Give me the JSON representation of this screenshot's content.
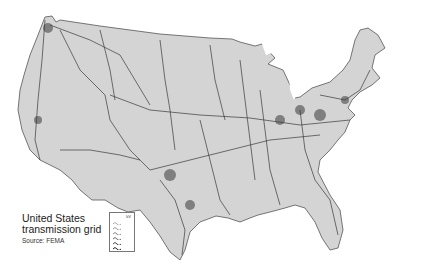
{
  "map": {
    "region": "Contiguous United States",
    "fill_color": "#d4d4d4",
    "line_color": "#3a3a3a",
    "background": "#ffffff"
  },
  "caption": {
    "title_line1": "United States",
    "title_line2": "transmission grid",
    "source": "Source: FEMA"
  },
  "legend": {
    "header": "kV",
    "entries": [
      "",
      "",
      "",
      "",
      "",
      ""
    ]
  }
}
